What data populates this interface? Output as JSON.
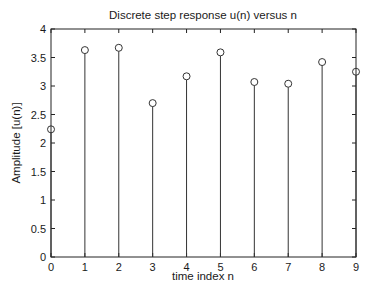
{
  "chart_data": {
    "type": "stem",
    "title": "Discrete step response u(n) versus n",
    "xlabel": "time index n",
    "ylabel": "Amplitude [u(n)]",
    "x": [
      0,
      1,
      2,
      3,
      4,
      5,
      6,
      7,
      8,
      9
    ],
    "values": [
      2.24,
      3.63,
      3.67,
      2.7,
      3.17,
      3.59,
      3.07,
      3.04,
      3.42,
      3.25
    ],
    "xlim": [
      0,
      9
    ],
    "ylim": [
      0,
      4
    ],
    "xticks": [
      "0",
      "1",
      "2",
      "3",
      "4",
      "5",
      "6",
      "7",
      "8",
      "9"
    ],
    "yticks": [
      "0",
      "0.5",
      "1",
      "1.5",
      "2",
      "2.5",
      "3",
      "3.5",
      "4"
    ],
    "grid": false,
    "legend": null,
    "marker": "open-circle",
    "colors": {
      "line": "#333333",
      "axis": "#222222",
      "background": "#ffffff"
    }
  }
}
